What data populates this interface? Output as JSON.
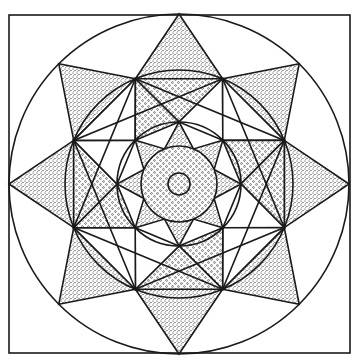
{
  "figure": {
    "type": "geometric-mandala-line-drawing",
    "frame": {
      "x": 9,
      "y": 15,
      "width": 341,
      "height": 338
    },
    "center": {
      "x": 179,
      "y": 184
    },
    "radii": {
      "outer_circle": 170,
      "middle_circle": 114,
      "inner_circle": 62,
      "central_disc": 38,
      "hole": 11
    },
    "star_points": 8,
    "colors": {
      "ink": "#1a1a1a",
      "paper": "#ffffff"
    },
    "fills": {
      "outer_star_tips": "dense-stipple",
      "inner_rings": "dot-stipple",
      "inner_star": "dense-stipple",
      "central_disc": "dot-stipple"
    }
  }
}
